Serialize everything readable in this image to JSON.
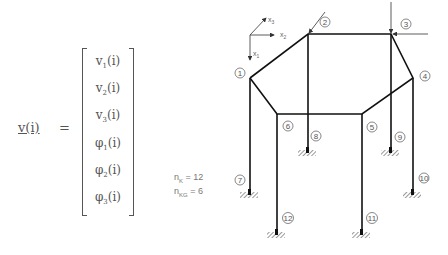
{
  "equation": {
    "lhs": "v(i)",
    "equals": "=",
    "vector": [
      {
        "sym": "v",
        "sub": "1",
        "arg": "(i)"
      },
      {
        "sym": "v",
        "sub": "2",
        "arg": "(i)"
      },
      {
        "sym": "v",
        "sub": "3",
        "arg": "(i)"
      },
      {
        "sym": "φ",
        "sub": "1",
        "arg": "(i)"
      },
      {
        "sym": "φ",
        "sub": "2",
        "arg": "(i)"
      },
      {
        "sym": "φ",
        "sub": "3",
        "arg": "(i)"
      }
    ]
  },
  "params": {
    "nk_label": "n",
    "nk_sub": "K",
    "nk_value": "= 12",
    "nkg_label": "n",
    "nkg_sub": "KG",
    "nkg_value": "= 6"
  },
  "axes": {
    "x1": "x",
    "x1_sub": "1",
    "x2": "x",
    "x2_sub": "2",
    "x3": "x",
    "x3_sub": "3"
  },
  "nodes": [
    {
      "id": "1",
      "x": 250,
      "y": 78
    },
    {
      "id": "2",
      "x": 308,
      "y": 34
    },
    {
      "id": "3",
      "x": 391,
      "y": 34
    },
    {
      "id": "4",
      "x": 413,
      "y": 78
    },
    {
      "id": "5",
      "x": 362,
      "y": 114
    },
    {
      "id": "6",
      "x": 277,
      "y": 114
    },
    {
      "id": "7",
      "x": 250,
      "y": 192
    },
    {
      "id": "8",
      "x": 307,
      "y": 150
    },
    {
      "id": "9",
      "x": 390,
      "y": 150
    },
    {
      "id": "10",
      "x": 413,
      "y": 192
    },
    {
      "id": "11",
      "x": 362,
      "y": 232
    },
    {
      "id": "12",
      "x": 277,
      "y": 232
    }
  ],
  "colors": {
    "line": "#1a1a1a",
    "text": "#555555"
  }
}
